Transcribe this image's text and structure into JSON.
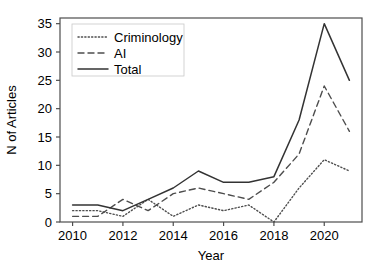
{
  "chart_data": {
    "type": "line",
    "title": "",
    "xlabel": "Year",
    "ylabel": "N of Articles",
    "x": [
      2010,
      2011,
      2012,
      2013,
      2014,
      2015,
      2016,
      2017,
      2018,
      2019,
      2020,
      2021
    ],
    "xlim": [
      2009.5,
      2021.5
    ],
    "ylim": [
      0,
      36
    ],
    "xticks": [
      2010,
      2012,
      2014,
      2016,
      2018,
      2020
    ],
    "xtick_labels": [
      "2010",
      "2012",
      "2014",
      "2016",
      "2018",
      "2020"
    ],
    "yticks": [
      0,
      5,
      10,
      15,
      20,
      25,
      30,
      35
    ],
    "ytick_labels": [
      "0",
      "5",
      "10",
      "15",
      "20",
      "25",
      "30",
      "35"
    ],
    "grid": false,
    "legend_position": "top-left",
    "series": [
      {
        "name": "Criminology",
        "style": "dotted",
        "color": "#4d4d4d",
        "values": [
          2,
          2,
          1,
          4,
          1,
          3,
          2,
          3,
          0,
          6,
          11,
          9
        ]
      },
      {
        "name": "AI",
        "style": "dashed",
        "color": "#4d4d4d",
        "values": [
          1,
          1,
          4,
          2,
          5,
          6,
          5,
          4,
          7,
          12,
          24,
          16
        ]
      },
      {
        "name": "Total",
        "style": "solid",
        "color": "#333333",
        "values": [
          3,
          3,
          2,
          4,
          6,
          9,
          7,
          7,
          8,
          18,
          35,
          25
        ]
      }
    ]
  },
  "legend": {
    "items": [
      {
        "label": "Criminology"
      },
      {
        "label": "AI"
      },
      {
        "label": "Total"
      }
    ]
  },
  "axes": {
    "x_title": "Year",
    "y_title": "N of Articles"
  }
}
